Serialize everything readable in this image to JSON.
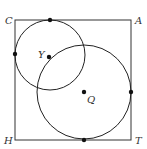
{
  "diagram": {
    "square": {
      "x": 15,
      "y": 20,
      "w": 116,
      "h": 120,
      "color": "#333333"
    },
    "labels": {
      "C": "C",
      "A": "A",
      "H": "H",
      "T": "T",
      "Y": "Y",
      "Q": "Q"
    },
    "small_circle": {
      "cx": 50,
      "cy": 55,
      "r": 35
    },
    "large_circle": {
      "cx": 84,
      "cy": 92,
      "r": 47
    }
  }
}
